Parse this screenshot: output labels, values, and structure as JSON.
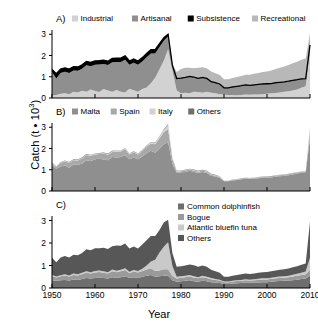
{
  "figure": {
    "ylabel_text": "Catch (t • 10",
    "ylabel_exp": "3",
    "ylabel_close": ")",
    "xlabel": "Year",
    "panel_labels": {
      "a": "A)",
      "b": "B)",
      "c": "C)"
    },
    "ytick_labels": [
      "0",
      "1",
      "2",
      "3"
    ],
    "xtick_labels": [
      "1950",
      "1960",
      "1970",
      "1980",
      "1990",
      "2000",
      "2010"
    ]
  },
  "colors": {
    "industrial": "#d2d2d2",
    "artisanal": "#8f8f8f",
    "subsistence": "#000000",
    "recreational": "#b8b8b8",
    "malta": "#8f8f8f",
    "spain": "#a8a8a8",
    "italy": "#d2d2d2",
    "others_b": "#6e6e6e",
    "dolphinfish": "#6e6e6e",
    "bogue": "#9a9a9a",
    "bluefin": "#c9c9c9",
    "others_c": "#575757",
    "axis": "#000000",
    "background": "#ffffff"
  },
  "chart_data": [
    {
      "type": "area",
      "panel": "A",
      "title": "A)",
      "stacked": true,
      "xlabel": "Year",
      "ylabel": "Catch (t • 10^3)",
      "xlim": [
        1950,
        2010
      ],
      "ylim": [
        0,
        3.2
      ],
      "grid": false,
      "legend_position": "top",
      "legend": [
        "Industrial",
        "Artisanal",
        "Subsistence",
        "Recreational"
      ],
      "x": [
        1950,
        1951,
        1952,
        1953,
        1954,
        1955,
        1956,
        1957,
        1958,
        1959,
        1960,
        1961,
        1962,
        1963,
        1964,
        1965,
        1966,
        1967,
        1968,
        1969,
        1970,
        1971,
        1972,
        1973,
        1974,
        1975,
        1976,
        1977,
        1978,
        1979,
        1980,
        1981,
        1982,
        1983,
        1984,
        1985,
        1986,
        1987,
        1988,
        1989,
        1990,
        1991,
        1992,
        1993,
        1994,
        1995,
        1996,
        1997,
        1998,
        1999,
        2000,
        2001,
        2002,
        2003,
        2004,
        2005,
        2006,
        2007,
        2008,
        2009,
        2010
      ],
      "series": [
        {
          "name": "Industrial",
          "values": [
            0.12,
            0.14,
            0.2,
            0.22,
            0.18,
            0.3,
            0.26,
            0.34,
            0.3,
            0.4,
            0.33,
            0.28,
            0.42,
            0.35,
            0.3,
            0.38,
            0.3,
            0.26,
            0.44,
            0.36,
            0.3,
            0.42,
            0.5,
            0.7,
            0.95,
            1.35,
            1.75,
            2.3,
            1.3,
            0.35,
            0.22,
            0.25,
            0.22,
            0.3,
            0.28,
            0.25,
            0.3,
            0.25,
            0.22,
            0.18,
            0.16,
            0.14,
            0.14,
            0.13,
            0.14,
            0.16,
            0.15,
            0.16,
            0.17,
            0.18,
            0.2,
            0.22,
            0.24,
            0.26,
            0.3,
            0.32,
            0.35,
            0.4,
            0.48,
            0.55,
            2.15
          ]
        },
        {
          "name": "Artisanal",
          "values": [
            1.1,
            0.78,
            0.98,
            1.02,
            1.0,
            1.0,
            1.02,
            1.04,
            1.24,
            1.1,
            1.24,
            1.3,
            1.18,
            1.2,
            1.38,
            1.32,
            1.4,
            1.54,
            1.12,
            1.3,
            1.26,
            1.3,
            1.42,
            1.4,
            1.15,
            1.05,
            0.95,
            0.6,
            0.2,
            0.55,
            0.7,
            0.7,
            0.78,
            0.66,
            0.62,
            0.7,
            0.6,
            0.5,
            0.48,
            0.46,
            0.3,
            0.32,
            0.36,
            0.4,
            0.42,
            0.44,
            0.42,
            0.44,
            0.45,
            0.46,
            0.45,
            0.44,
            0.46,
            0.46,
            0.44,
            0.45,
            0.46,
            0.44,
            0.4,
            0.34,
            0.33
          ]
        },
        {
          "name": "Subsistence",
          "values": [
            0.12,
            0.22,
            0.18,
            0.18,
            0.18,
            0.18,
            0.18,
            0.18,
            0.18,
            0.18,
            0.18,
            0.18,
            0.18,
            0.18,
            0.18,
            0.18,
            0.18,
            0.18,
            0.18,
            0.18,
            0.18,
            0.18,
            0.18,
            0.18,
            0.18,
            0.16,
            0.14,
            0.1,
            0.04,
            0.02,
            0.02,
            0.02,
            0.02,
            0.02,
            0.02,
            0.02,
            0.02,
            0.02,
            0.02,
            0.02,
            0.02,
            0.02,
            0.02,
            0.02,
            0.02,
            0.02,
            0.02,
            0.02,
            0.02,
            0.02,
            0.02,
            0.02,
            0.02,
            0.02,
            0.02,
            0.02,
            0.02,
            0.02,
            0.02,
            0.02,
            0.02
          ]
        },
        {
          "name": "Recreational",
          "values": [
            0.0,
            0.0,
            0.0,
            0.0,
            0.0,
            0.0,
            0.0,
            0.0,
            0.0,
            0.0,
            0.0,
            0.0,
            0.0,
            0.0,
            0.0,
            0.0,
            0.0,
            0.0,
            0.0,
            0.0,
            0.0,
            0.0,
            0.0,
            0.0,
            0.0,
            0.0,
            0.0,
            0.0,
            0.05,
            0.3,
            0.42,
            0.45,
            0.4,
            0.42,
            0.5,
            0.48,
            0.48,
            0.48,
            0.45,
            0.42,
            0.4,
            0.4,
            0.42,
            0.44,
            0.46,
            0.48,
            0.5,
            0.52,
            0.54,
            0.56,
            0.58,
            0.62,
            0.64,
            0.68,
            0.72,
            0.76,
            0.8,
            0.85,
            0.9,
            0.95,
            0.55
          ]
        }
      ],
      "total_line": [
        1.34,
        1.14,
        1.36,
        1.42,
        1.36,
        1.48,
        1.46,
        1.56,
        1.72,
        1.68,
        1.75,
        1.76,
        1.78,
        1.73,
        1.86,
        1.88,
        1.88,
        1.98,
        1.74,
        1.84,
        1.74,
        1.9,
        2.1,
        2.28,
        2.28,
        2.56,
        2.84,
        3.0,
        1.54,
        0.92,
        0.94,
        0.97,
        1.02,
        0.98,
        0.92,
        0.97,
        0.92,
        0.77,
        0.72,
        0.66,
        0.48,
        0.48,
        0.52,
        0.55,
        0.58,
        0.62,
        0.59,
        0.62,
        0.64,
        0.66,
        0.67,
        0.68,
        0.72,
        0.74,
        0.76,
        0.79,
        0.83,
        0.86,
        0.9,
        0.91,
        2.5
      ]
    },
    {
      "type": "area",
      "panel": "B",
      "title": "B)",
      "stacked": true,
      "xlabel": "Year",
      "ylabel": "Catch (t • 10^3)",
      "xlim": [
        1950,
        2010
      ],
      "ylim": [
        0,
        3.2
      ],
      "grid": false,
      "legend_position": "top",
      "legend": [
        "Malta",
        "Spain",
        "Italy",
        "Others"
      ],
      "x": [
        1950,
        1951,
        1952,
        1953,
        1954,
        1955,
        1956,
        1957,
        1958,
        1959,
        1960,
        1961,
        1962,
        1963,
        1964,
        1965,
        1966,
        1967,
        1968,
        1969,
        1970,
        1971,
        1972,
        1973,
        1974,
        1975,
        1976,
        1977,
        1978,
        1979,
        1980,
        1981,
        1982,
        1983,
        1984,
        1985,
        1986,
        1987,
        1988,
        1989,
        1990,
        1991,
        1992,
        1993,
        1994,
        1995,
        1996,
        1997,
        1998,
        1999,
        2000,
        2001,
        2002,
        2003,
        2004,
        2005,
        2006,
        2007,
        2008,
        2009,
        2010
      ],
      "series": [
        {
          "name": "Malta",
          "values": [
            1.2,
            1.05,
            1.15,
            1.2,
            1.1,
            1.25,
            1.22,
            1.3,
            1.45,
            1.4,
            1.5,
            1.52,
            1.48,
            1.45,
            1.6,
            1.58,
            1.6,
            1.7,
            1.5,
            1.58,
            1.5,
            1.62,
            1.78,
            1.9,
            1.8,
            2.0,
            2.2,
            2.3,
            1.3,
            0.85,
            0.88,
            0.9,
            0.95,
            0.9,
            0.86,
            0.9,
            0.85,
            0.72,
            0.68,
            0.62,
            0.46,
            0.46,
            0.5,
            0.52,
            0.55,
            0.58,
            0.56,
            0.58,
            0.6,
            0.62,
            0.63,
            0.64,
            0.68,
            0.7,
            0.72,
            0.74,
            0.78,
            0.82,
            0.86,
            0.88,
            2.45
          ]
        },
        {
          "name": "Spain",
          "values": [
            0.1,
            0.08,
            0.18,
            0.2,
            0.22,
            0.2,
            0.22,
            0.24,
            0.24,
            0.26,
            0.22,
            0.22,
            0.28,
            0.26,
            0.24,
            0.28,
            0.26,
            0.26,
            0.22,
            0.24,
            0.22,
            0.26,
            0.3,
            0.34,
            0.4,
            0.48,
            0.56,
            0.62,
            0.2,
            0.06,
            0.05,
            0.06,
            0.06,
            0.07,
            0.05,
            0.06,
            0.06,
            0.05,
            0.04,
            0.04,
            0.02,
            0.02,
            0.02,
            0.03,
            0.03,
            0.04,
            0.03,
            0.04,
            0.04,
            0.04,
            0.04,
            0.05,
            0.04,
            0.04,
            0.04,
            0.05,
            0.05,
            0.04,
            0.04,
            0.03,
            0.35
          ]
        },
        {
          "name": "Italy",
          "values": [
            0.02,
            0.02,
            0.02,
            0.02,
            0.02,
            0.02,
            0.02,
            0.03,
            0.03,
            0.03,
            0.03,
            0.03,
            0.03,
            0.03,
            0.03,
            0.03,
            0.03,
            0.03,
            0.03,
            0.03,
            0.03,
            0.03,
            0.04,
            0.05,
            0.06,
            0.08,
            0.12,
            0.2,
            0.06,
            0.02,
            0.02,
            0.02,
            0.02,
            0.02,
            0.02,
            0.02,
            0.02,
            0.02,
            0.02,
            0.02,
            0.01,
            0.01,
            0.01,
            0.01,
            0.01,
            0.01,
            0.01,
            0.01,
            0.01,
            0.01,
            0.01,
            0.01,
            0.01,
            0.01,
            0.01,
            0.01,
            0.01,
            0.01,
            0.01,
            0.01,
            0.1
          ]
        },
        {
          "name": "Others",
          "values": [
            0.02,
            0.02,
            0.02,
            0.02,
            0.02,
            0.02,
            0.02,
            0.02,
            0.02,
            0.02,
            0.02,
            0.02,
            0.02,
            0.02,
            0.02,
            0.02,
            0.02,
            0.02,
            0.02,
            0.02,
            0.02,
            0.02,
            0.02,
            0.02,
            0.02,
            0.02,
            0.02,
            0.03,
            0.02,
            0.02,
            0.02,
            0.02,
            0.02,
            0.02,
            0.02,
            0.02,
            0.02,
            0.02,
            0.02,
            0.02,
            0.01,
            0.01,
            0.01,
            0.01,
            0.01,
            0.01,
            0.01,
            0.01,
            0.01,
            0.01,
            0.01,
            0.01,
            0.01,
            0.01,
            0.01,
            0.01,
            0.01,
            0.01,
            0.01,
            0.01,
            0.05
          ]
        }
      ]
    },
    {
      "type": "area",
      "panel": "C",
      "title": "C)",
      "stacked": true,
      "xlabel": "Year",
      "ylabel": "Catch (t • 10^3)",
      "xlim": [
        1950,
        2010
      ],
      "ylim": [
        0,
        3.2
      ],
      "grid": false,
      "legend_position": "top-right",
      "legend": [
        "Common dolphinfish",
        "Bogue",
        "Atlantic bluefin tuna",
        "Others"
      ],
      "x": [
        1950,
        1951,
        1952,
        1953,
        1954,
        1955,
        1956,
        1957,
        1958,
        1959,
        1960,
        1961,
        1962,
        1963,
        1964,
        1965,
        1966,
        1967,
        1968,
        1969,
        1970,
        1971,
        1972,
        1973,
        1974,
        1975,
        1976,
        1977,
        1978,
        1979,
        1980,
        1981,
        1982,
        1983,
        1984,
        1985,
        1986,
        1987,
        1988,
        1989,
        1990,
        1991,
        1992,
        1993,
        1994,
        1995,
        1996,
        1997,
        1998,
        1999,
        2000,
        2001,
        2002,
        2003,
        2004,
        2005,
        2006,
        2007,
        2008,
        2009,
        2010
      ],
      "series": [
        {
          "name": "Common dolphinfish",
          "values": [
            0.35,
            0.32,
            0.34,
            0.36,
            0.33,
            0.38,
            0.36,
            0.4,
            0.44,
            0.42,
            0.45,
            0.46,
            0.44,
            0.42,
            0.48,
            0.46,
            0.48,
            0.52,
            0.44,
            0.48,
            0.45,
            0.5,
            0.54,
            0.58,
            0.5,
            0.52,
            0.55,
            0.55,
            0.35,
            0.28,
            0.3,
            0.32,
            0.34,
            0.3,
            0.28,
            0.32,
            0.3,
            0.26,
            0.24,
            0.22,
            0.18,
            0.18,
            0.2,
            0.21,
            0.22,
            0.24,
            0.23,
            0.24,
            0.25,
            0.26,
            0.26,
            0.28,
            0.3,
            0.31,
            0.32,
            0.33,
            0.35,
            0.37,
            0.4,
            0.42,
            0.55
          ]
        },
        {
          "name": "Bogue",
          "values": [
            0.18,
            0.15,
            0.18,
            0.2,
            0.18,
            0.2,
            0.2,
            0.22,
            0.24,
            0.22,
            0.24,
            0.25,
            0.24,
            0.22,
            0.26,
            0.24,
            0.26,
            0.28,
            0.22,
            0.25,
            0.24,
            0.26,
            0.28,
            0.3,
            0.26,
            0.26,
            0.28,
            0.28,
            0.18,
            0.14,
            0.16,
            0.16,
            0.18,
            0.16,
            0.15,
            0.16,
            0.15,
            0.13,
            0.12,
            0.11,
            0.08,
            0.08,
            0.09,
            0.1,
            0.1,
            0.11,
            0.1,
            0.11,
            0.11,
            0.12,
            0.12,
            0.13,
            0.13,
            0.14,
            0.14,
            0.15,
            0.16,
            0.17,
            0.18,
            0.19,
            0.25
          ]
        },
        {
          "name": "Atlantic bluefin tuna",
          "values": [
            0.05,
            0.04,
            0.05,
            0.05,
            0.05,
            0.06,
            0.05,
            0.06,
            0.07,
            0.06,
            0.07,
            0.07,
            0.07,
            0.06,
            0.08,
            0.07,
            0.07,
            0.08,
            0.06,
            0.07,
            0.07,
            0.1,
            0.18,
            0.3,
            0.5,
            0.8,
            1.0,
            1.2,
            0.45,
            0.08,
            0.06,
            0.06,
            0.06,
            0.06,
            0.05,
            0.06,
            0.05,
            0.05,
            0.04,
            0.04,
            0.03,
            0.03,
            0.03,
            0.04,
            0.04,
            0.04,
            0.04,
            0.04,
            0.05,
            0.05,
            0.05,
            0.05,
            0.06,
            0.06,
            0.06,
            0.07,
            0.08,
            0.09,
            0.1,
            0.12,
            0.55
          ]
        },
        {
          "name": "Others",
          "values": [
            0.76,
            0.63,
            0.79,
            0.81,
            0.8,
            0.84,
            0.85,
            0.88,
            0.97,
            0.98,
            1.01,
            0.99,
            1.04,
            1.03,
            1.04,
            1.12,
            1.07,
            1.1,
            1.04,
            1.05,
            1.0,
            1.07,
            1.12,
            1.13,
            1.05,
            1.0,
            1.08,
            1.0,
            0.58,
            0.45,
            0.45,
            0.46,
            0.47,
            0.49,
            0.47,
            0.46,
            0.45,
            0.37,
            0.34,
            0.31,
            0.21,
            0.21,
            0.22,
            0.23,
            0.25,
            0.26,
            0.25,
            0.26,
            0.27,
            0.27,
            0.28,
            0.28,
            0.29,
            0.3,
            0.31,
            0.32,
            0.33,
            0.34,
            0.35,
            0.36,
            1.6
          ]
        }
      ]
    }
  ]
}
